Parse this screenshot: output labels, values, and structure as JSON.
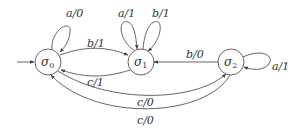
{
  "diagram": {
    "type": "finite-state-machine",
    "states": [
      {
        "id": "s0",
        "symbol": "σ",
        "sub": "0",
        "initial": true
      },
      {
        "id": "s1",
        "symbol": "σ",
        "sub": "1"
      },
      {
        "id": "s2",
        "symbol": "σ",
        "sub": "2"
      }
    ],
    "transitions": [
      {
        "from": "s0",
        "to": "s0",
        "label": "a/0"
      },
      {
        "from": "s0",
        "to": "s1",
        "label": "b/1"
      },
      {
        "from": "s1",
        "to": "s0",
        "label": "c/1"
      },
      {
        "from": "s1",
        "to": "s1",
        "label": "a/1"
      },
      {
        "from": "s1",
        "to": "s1",
        "label": "b/1"
      },
      {
        "from": "s2",
        "to": "s1",
        "label": "b/0"
      },
      {
        "from": "s2",
        "to": "s2",
        "label": "a/1"
      },
      {
        "from": "s0",
        "to": "s2",
        "label": "c/0"
      },
      {
        "from": "s2",
        "to": "s0",
        "label": "c/0"
      }
    ]
  },
  "labels": {
    "s0_sym": "σ",
    "s0_sub": "0",
    "s1_sym": "σ",
    "s1_sub": "1",
    "s2_sym": "σ",
    "s2_sub": "2",
    "t_s0_loop": "a/0",
    "t_s0_s1": "b/1",
    "t_s1_s0": "c/1",
    "t_s1_loop_a": "a/1",
    "t_s1_loop_b": "b/1",
    "t_s2_s1": "b/0",
    "t_s2_loop": "a/1",
    "t_s0_s2": "c/0",
    "t_s2_s0": "c/0"
  }
}
